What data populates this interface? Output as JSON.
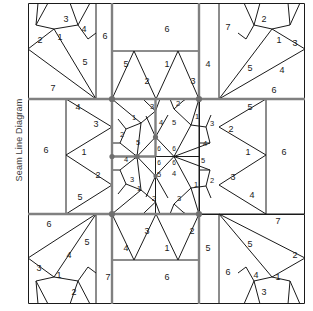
{
  "page": {
    "side_label": "Seam Line Diagram",
    "background": "#ffffff",
    "line_color": "#1a1a1a",
    "grid_color": "#7a7a7a",
    "label_color": "#1a1a1a"
  },
  "diagram": {
    "type": "quilt-seam-line-diagram",
    "width": 277,
    "height": 301,
    "grid": {
      "vertical_x": [
        0,
        84,
        171,
        277
      ],
      "horizontal_y": [
        0,
        96,
        211,
        301
      ]
    },
    "blocks": [
      {
        "name": "corner-top-left",
        "labels": [
          "3",
          "4",
          "2",
          "1",
          "6",
          "5",
          "7"
        ]
      },
      {
        "name": "edge-top-center",
        "labels": [
          "6",
          "5",
          "1",
          "4",
          "2",
          "3"
        ]
      },
      {
        "name": "corner-top-right",
        "labels": [
          "2",
          "7",
          "1",
          "3",
          "5",
          "4",
          "6"
        ]
      },
      {
        "name": "edge-middle-left",
        "labels": [
          "4",
          "3",
          "6",
          "1",
          "2",
          "5"
        ]
      },
      {
        "name": "center-block",
        "labels": [
          "3",
          "1",
          "4",
          "2",
          "5",
          "1",
          "2",
          "5",
          "6",
          "6",
          "4",
          "3",
          "1",
          "2",
          "6",
          "6",
          "5",
          "4",
          "1",
          "2",
          "3",
          "5"
        ]
      },
      {
        "name": "edge-middle-right",
        "labels": [
          "5",
          "2",
          "1",
          "3",
          "4",
          "6"
        ]
      },
      {
        "name": "corner-bottom-left",
        "labels": [
          "6",
          "4",
          "5",
          "3",
          "1",
          "2",
          "7"
        ]
      },
      {
        "name": "edge-bottom-center",
        "labels": [
          "3",
          "2",
          "4",
          "1",
          "5",
          "6"
        ]
      },
      {
        "name": "corner-bottom-right",
        "labels": [
          "7",
          "5",
          "2",
          "6",
          "4",
          "1",
          "3"
        ]
      }
    ],
    "labels": [
      {
        "id": "tl-3",
        "text": "3",
        "x": 38,
        "y": 17
      },
      {
        "id": "tl-4",
        "text": "4",
        "x": 56,
        "y": 27
      },
      {
        "id": "tl-2",
        "text": "2",
        "x": 12,
        "y": 38
      },
      {
        "id": "tl-1",
        "text": "1",
        "x": 32,
        "y": 35
      },
      {
        "id": "tl-6",
        "text": "6",
        "x": 77,
        "y": 34
      },
      {
        "id": "tl-5",
        "text": "5",
        "x": 57,
        "y": 60
      },
      {
        "id": "tl-7",
        "text": "7",
        "x": 25,
        "y": 86
      },
      {
        "id": "tc-6",
        "text": "6",
        "x": 139,
        "y": 27
      },
      {
        "id": "tc-5",
        "text": "5",
        "x": 98,
        "y": 62
      },
      {
        "id": "tc-1",
        "text": "1",
        "x": 139,
        "y": 62
      },
      {
        "id": "tc-4",
        "text": "4",
        "x": 180,
        "y": 62
      },
      {
        "id": "tc-2",
        "text": "2",
        "x": 119,
        "y": 79
      },
      {
        "id": "tc-3",
        "text": "3",
        "x": 165,
        "y": 79
      },
      {
        "id": "tr-2",
        "text": "2",
        "x": 236,
        "y": 17
      },
      {
        "id": "tr-7",
        "text": "7",
        "x": 200,
        "y": 25
      },
      {
        "id": "tr-1",
        "text": "1",
        "x": 251,
        "y": 38
      },
      {
        "id": "tr-3",
        "text": "3",
        "x": 267,
        "y": 41
      },
      {
        "id": "tr-5",
        "text": "5",
        "x": 222,
        "y": 66
      },
      {
        "id": "tr-4",
        "text": "4",
        "x": 254,
        "y": 68
      },
      {
        "id": "tr-6",
        "text": "6",
        "x": 246,
        "y": 88
      },
      {
        "id": "ml-4",
        "text": "4",
        "x": 50,
        "y": 105
      },
      {
        "id": "ml-3",
        "text": "3",
        "x": 68,
        "y": 122
      },
      {
        "id": "ml-6",
        "text": "6",
        "x": 18,
        "y": 148
      },
      {
        "id": "ml-1",
        "text": "1",
        "x": 56,
        "y": 150
      },
      {
        "id": "ml-2",
        "text": "2",
        "x": 70,
        "y": 173
      },
      {
        "id": "ml-5",
        "text": "5",
        "x": 52,
        "y": 195
      },
      {
        "id": "mr-5",
        "text": "5",
        "x": 222,
        "y": 105
      },
      {
        "id": "mr-2",
        "text": "2",
        "x": 203,
        "y": 127
      },
      {
        "id": "mr-6",
        "text": "6",
        "x": 256,
        "y": 150
      },
      {
        "id": "mr-1",
        "text": "1",
        "x": 220,
        "y": 150
      },
      {
        "id": "mr-3",
        "text": "3",
        "x": 205,
        "y": 175
      },
      {
        "id": "mr-4",
        "text": "4",
        "x": 224,
        "y": 193
      },
      {
        "id": "c-tl-3",
        "text": "3",
        "x": 124,
        "y": 104
      },
      {
        "id": "c-tl-1",
        "text": "1",
        "x": 106,
        "y": 115
      },
      {
        "id": "c-tl-4",
        "text": "4",
        "x": 133,
        "y": 120
      },
      {
        "id": "c-tl-2",
        "text": "2",
        "x": 94,
        "y": 132
      },
      {
        "id": "c-tl-5",
        "text": "5",
        "x": 110,
        "y": 140
      },
      {
        "id": "c-tr-2",
        "text": "2",
        "x": 150,
        "y": 101
      },
      {
        "id": "c-tr-1",
        "text": "1",
        "x": 169,
        "y": 114
      },
      {
        "id": "c-tr-5",
        "text": "5",
        "x": 146,
        "y": 120
      },
      {
        "id": "c-tr-3",
        "text": "3",
        "x": 184,
        "y": 121
      },
      {
        "id": "c-tr-4",
        "text": "4",
        "x": 177,
        "y": 141
      },
      {
        "id": "c-bl-4",
        "text": "4",
        "x": 98,
        "y": 157
      },
      {
        "id": "c-bl-3",
        "text": "3",
        "x": 104,
        "y": 177
      },
      {
        "id": "c-bl-1",
        "text": "1",
        "x": 111,
        "y": 186
      },
      {
        "id": "c-bl-2",
        "text": "2",
        "x": 126,
        "y": 196
      },
      {
        "id": "c-bl-5",
        "text": "5",
        "x": 131,
        "y": 172
      },
      {
        "id": "c-br-5",
        "text": "5",
        "x": 175,
        "y": 158
      },
      {
        "id": "c-br-4",
        "text": "4",
        "x": 146,
        "y": 171
      },
      {
        "id": "c-br-1",
        "text": "1",
        "x": 168,
        "y": 182
      },
      {
        "id": "c-br-2",
        "text": "2",
        "x": 184,
        "y": 178
      },
      {
        "id": "c-br-3",
        "text": "3",
        "x": 151,
        "y": 196
      },
      {
        "id": "c-6a",
        "text": "6",
        "x": 131,
        "y": 146
      },
      {
        "id": "c-6b",
        "text": "6",
        "x": 146,
        "y": 146
      },
      {
        "id": "c-6c",
        "text": "6",
        "x": 131,
        "y": 160
      },
      {
        "id": "c-6d",
        "text": "6",
        "x": 146,
        "y": 160
      },
      {
        "id": "bl-6",
        "text": "6",
        "x": 21,
        "y": 222
      },
      {
        "id": "bl-4",
        "text": "4",
        "x": 41,
        "y": 253
      },
      {
        "id": "bl-5",
        "text": "5",
        "x": 59,
        "y": 240
      },
      {
        "id": "bl-3",
        "text": "3",
        "x": 11,
        "y": 266
      },
      {
        "id": "bl-1",
        "text": "1",
        "x": 31,
        "y": 273
      },
      {
        "id": "bl-2",
        "text": "2",
        "x": 46,
        "y": 290
      },
      {
        "id": "bl-7",
        "text": "7",
        "x": 80,
        "y": 275
      },
      {
        "id": "bc-3",
        "text": "3",
        "x": 119,
        "y": 229
      },
      {
        "id": "bc-2",
        "text": "2",
        "x": 164,
        "y": 229
      },
      {
        "id": "bc-4",
        "text": "4",
        "x": 98,
        "y": 246
      },
      {
        "id": "bc-1",
        "text": "1",
        "x": 139,
        "y": 246
      },
      {
        "id": "bc-5",
        "text": "5",
        "x": 180,
        "y": 246
      },
      {
        "id": "bc-6",
        "text": "6",
        "x": 139,
        "y": 275
      },
      {
        "id": "br-7",
        "text": "7",
        "x": 250,
        "y": 219
      },
      {
        "id": "br-5",
        "text": "5",
        "x": 222,
        "y": 242
      },
      {
        "id": "br-2",
        "text": "2",
        "x": 267,
        "y": 253
      },
      {
        "id": "br-6",
        "text": "6",
        "x": 200,
        "y": 270
      },
      {
        "id": "br-4",
        "text": "4",
        "x": 228,
        "y": 273
      },
      {
        "id": "br-1",
        "text": "1",
        "x": 250,
        "y": 275
      },
      {
        "id": "br-3",
        "text": "3",
        "x": 236,
        "y": 290
      }
    ]
  }
}
